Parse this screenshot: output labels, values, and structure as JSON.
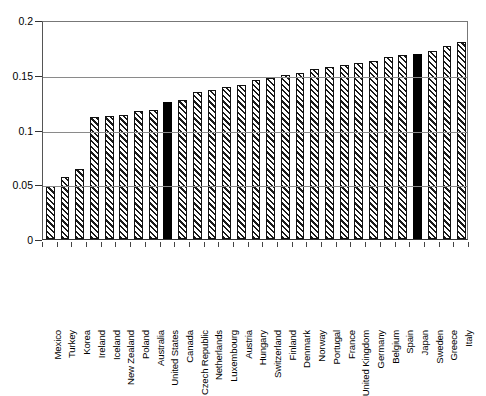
{
  "chart_data": {
    "type": "bar",
    "title": "",
    "subtitle": "",
    "xlabel": "",
    "ylabel": "",
    "ylim": [
      0,
      0.2
    ],
    "yticks": [
      "0",
      "0.05",
      "0.1",
      "0.15",
      "0.2"
    ],
    "ytick_values": [
      0,
      0.05,
      0.1,
      0.15,
      0.2
    ],
    "grid": true,
    "legend": "none",
    "highlight_color": "#000000",
    "bar_fill": "hatched-diagonal",
    "categories": [
      "Mexico",
      "Turkey",
      "Korea",
      "Ireland",
      "Iceland",
      "New Zealand",
      "Poland",
      "Australia",
      "United States",
      "Canada",
      "Czech Republic",
      "Netherlands",
      "Luxembourg",
      "Austria",
      "Hungary",
      "Switzerland",
      "Finland",
      "Denmark",
      "Norway",
      "Portugal",
      "France",
      "United Kingdom",
      "Germany",
      "Belgium",
      "Spain",
      "Japan",
      "Sweden",
      "Greece",
      "Italy"
    ],
    "values": [
      0.048,
      0.057,
      0.064,
      0.111,
      0.112,
      0.113,
      0.117,
      0.118,
      0.125,
      0.127,
      0.134,
      0.136,
      0.139,
      0.141,
      0.145,
      0.147,
      0.15,
      0.152,
      0.155,
      0.157,
      0.159,
      0.161,
      0.163,
      0.166,
      0.168,
      0.169,
      0.172,
      0.176,
      0.18
    ],
    "highlighted": [
      "United States",
      "Japan"
    ]
  }
}
